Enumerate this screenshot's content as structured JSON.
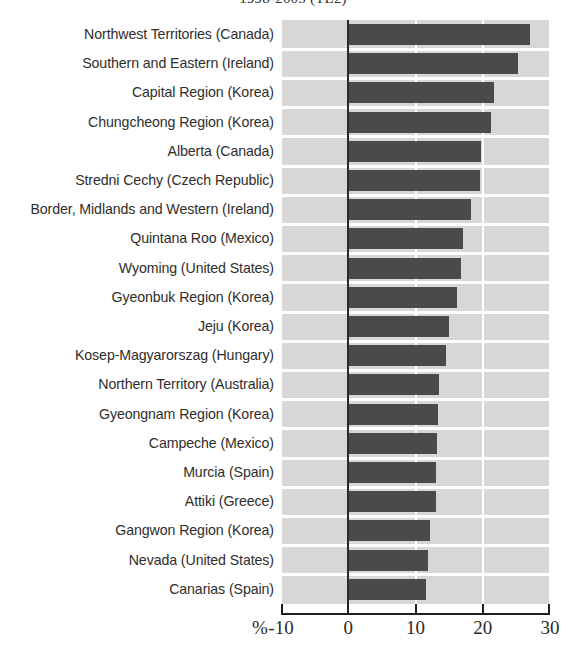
{
  "chart_data": {
    "type": "bar",
    "orientation": "horizontal",
    "title": "1998-2005 (TL2)",
    "xlabel": "%",
    "ylabel": "",
    "xlim": [
      -10,
      30
    ],
    "xticks": [
      -10,
      0,
      10,
      20,
      30
    ],
    "xtick_labels": [
      "-10",
      "0",
      "10",
      "20",
      "30"
    ],
    "grid": true,
    "grid_axis": "x",
    "legend": "none",
    "bar_color": "#4a4a48",
    "plot_background": "#d7d7d5",
    "categories": [
      "Northwest Territories (Canada)",
      "Southern and Eastern (Ireland)",
      "Capital Region (Korea)",
      "Chungcheong Region (Korea)",
      "Alberta (Canada)",
      "Stredni Cechy (Czech Republic)",
      "Border, Midlands and Western (Ireland)",
      "Quintana Roo (Mexico)",
      "Wyoming (United States)",
      "Gyeonbuk Region (Korea)",
      "Jeju (Korea)",
      "Kosep-Magyarorszag (Hungary)",
      "Northern Territory (Australia)",
      "Gyeongnam Region (Korea)",
      "Campeche (Mexico)",
      "Murcia (Spain)",
      "Attiki (Greece)",
      "Gangwon Region (Korea)",
      "Nevada (United States)",
      "Canarias  (Spain)"
    ],
    "values": [
      27.0,
      25.2,
      21.7,
      21.2,
      19.7,
      19.6,
      18.3,
      17.0,
      16.8,
      16.2,
      15.0,
      14.6,
      13.5,
      13.3,
      13.2,
      13.1,
      13.0,
      12.2,
      11.8,
      11.6
    ]
  },
  "percent_symbol": "%"
}
